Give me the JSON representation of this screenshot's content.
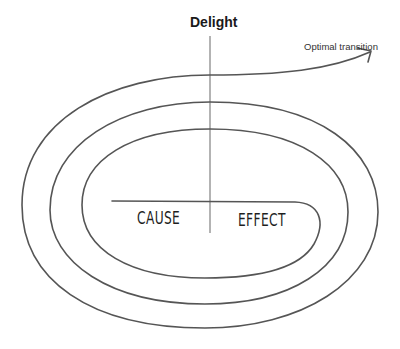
{
  "diagram": {
    "type": "spiral",
    "title": "Delight",
    "annotation": "Optimal transition",
    "quadrants": {
      "left": "CAUSE",
      "right": "EFFECT"
    },
    "colors": {
      "stroke": "#555555",
      "axis": "#888888",
      "text": "#1a1a1a",
      "background": "#ffffff"
    }
  }
}
